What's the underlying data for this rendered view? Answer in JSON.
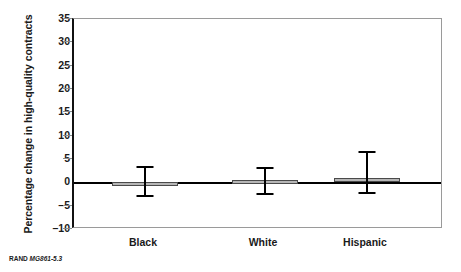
{
  "chart_data": {
    "type": "bar",
    "title": "",
    "xlabel": "",
    "ylabel": "Percentage change in high-quality contracts",
    "categories": [
      "Black",
      "White",
      "Hispanic"
    ],
    "values": [
      -0.8,
      0.5,
      1.0
    ],
    "series": [
      {
        "name": "Percentage change in high-quality contracts",
        "values": [
          -0.8,
          0.5,
          1.0
        ],
        "error_low": [
          -2.8,
          -2.3,
          -2.0
        ],
        "error_high": [
          3.5,
          3.2,
          6.7
        ]
      }
    ],
    "ylim": [
      -10,
      35
    ],
    "yticks": [
      35,
      30,
      25,
      20,
      15,
      10,
      5,
      0,
      -5,
      -10
    ],
    "ytick_labels": [
      "35",
      "30",
      "25",
      "20",
      "15",
      "10",
      "5",
      "0",
      "-5",
      "-10"
    ],
    "grid": false,
    "legend": "none",
    "zero_line": true,
    "bar_color": "#b6b6b6",
    "bar_edge_color": "#4a4a4a",
    "error_bar_color": "#000000",
    "axis_color": "#111111"
  },
  "caption": {
    "publisher": "RAND",
    "figure_code": "MG861-5.3"
  }
}
